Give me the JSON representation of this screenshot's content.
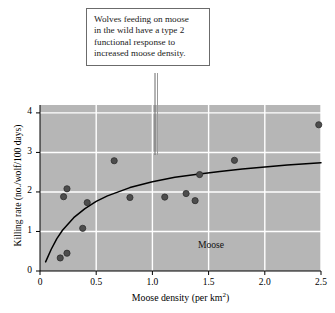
{
  "figure": {
    "background_color": "#ffffff",
    "plot_background_color": "#b6b6b6",
    "gridline_color": "#ffffff",
    "point_color": "#4d4d4d",
    "curve_color": "#000000",
    "axis_color": "#000000"
  },
  "annotation": {
    "name": "callout-box",
    "lines": [
      "Wolves feeding on moose",
      "in the wild have a type 2",
      "functional response to",
      "increased moose density."
    ],
    "full_text": "Wolves feeding on moose in the wild have a type 2 functional response to increased moose density.",
    "border_color": "#6b6b6b",
    "background_color": "#ffffff"
  },
  "chart_data": {
    "type": "scatter",
    "title": "",
    "subtitle": "",
    "xlabel": "Moose density (per km²)",
    "ylabel": "Killing rate (no./wolf/100 days)",
    "xlim": [
      0,
      2.5
    ],
    "ylim": [
      0,
      4.2
    ],
    "xticks": [
      0,
      0.5,
      1.0,
      1.5,
      2.0,
      2.5
    ],
    "xticklabels": [
      "0",
      "0.5",
      "1.0",
      "1.5",
      "2.0",
      "2.5"
    ],
    "yticks": [
      0,
      1,
      2,
      3,
      4
    ],
    "yticklabels": [
      "0",
      "1",
      "2",
      "3",
      "4"
    ],
    "grid": true,
    "grid_axis": "both",
    "legend": false,
    "series_annotation": "Moose",
    "series": [
      {
        "name": "Moose",
        "type": "scatter",
        "marker": "circle",
        "color": "#4d4d4d",
        "points": [
          {
            "x": 0.18,
            "y": 0.33
          },
          {
            "x": 0.24,
            "y": 0.45
          },
          {
            "x": 0.21,
            "y": 1.88
          },
          {
            "x": 0.24,
            "y": 2.08
          },
          {
            "x": 0.38,
            "y": 1.08
          },
          {
            "x": 0.42,
            "y": 1.73
          },
          {
            "x": 0.66,
            "y": 2.79
          },
          {
            "x": 0.8,
            "y": 1.86
          },
          {
            "x": 1.11,
            "y": 1.87
          },
          {
            "x": 1.3,
            "y": 1.96
          },
          {
            "x": 1.38,
            "y": 1.78
          },
          {
            "x": 1.42,
            "y": 2.44
          },
          {
            "x": 1.73,
            "y": 2.8
          },
          {
            "x": 2.48,
            "y": 3.7
          }
        ]
      },
      {
        "name": "Type 2 functional response fit",
        "type": "line",
        "color": "#000000",
        "description": "Saturating type II (Holling) curve",
        "points": [
          {
            "x": 0.05,
            "y": 0.23
          },
          {
            "x": 0.1,
            "y": 0.55
          },
          {
            "x": 0.15,
            "y": 0.82
          },
          {
            "x": 0.2,
            "y": 1.03
          },
          {
            "x": 0.3,
            "y": 1.35
          },
          {
            "x": 0.4,
            "y": 1.58
          },
          {
            "x": 0.5,
            "y": 1.76
          },
          {
            "x": 0.6,
            "y": 1.9
          },
          {
            "x": 0.8,
            "y": 2.11
          },
          {
            "x": 1.0,
            "y": 2.26
          },
          {
            "x": 1.2,
            "y": 2.37
          },
          {
            "x": 1.4,
            "y": 2.45
          },
          {
            "x": 1.6,
            "y": 2.52
          },
          {
            "x": 1.8,
            "y": 2.58
          },
          {
            "x": 2.0,
            "y": 2.63
          },
          {
            "x": 2.2,
            "y": 2.68
          },
          {
            "x": 2.5,
            "y": 2.74
          }
        ]
      }
    ]
  }
}
